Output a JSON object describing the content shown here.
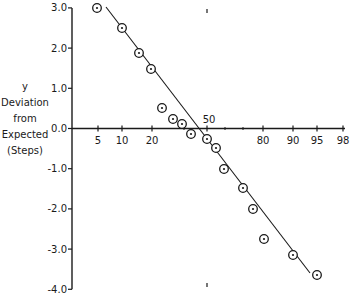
{
  "chart_data": {
    "type": "scatter",
    "title": "",
    "xlabel": "",
    "ylabel": [
      "y",
      "Deviation",
      "from",
      "Expected",
      "(Steps)"
    ],
    "x_scale": "normal-probability",
    "x_ticks": [
      5,
      10,
      20,
      50,
      80,
      90,
      95,
      98
    ],
    "x_minor_ticks": [
      30,
      60,
      70
    ],
    "y_ticks": [
      "3.0",
      "2.0",
      "1.0",
      "0.0",
      "-1.0",
      "-2.0",
      "-3.0",
      "-4.0"
    ],
    "ylim": [
      -4.0,
      3.0
    ],
    "grid": false,
    "legend": null,
    "marker": "circled-dot",
    "series": [
      {
        "name": "observed",
        "points": [
          {
            "x": 5,
            "y": 3.0
          },
          {
            "x": 10,
            "y": 2.5
          },
          {
            "x": 15,
            "y": 1.9
          },
          {
            "x": 20,
            "y": 1.5
          },
          {
            "x": 25,
            "y": 0.5
          },
          {
            "x": 30,
            "y": 0.25
          },
          {
            "x": 35,
            "y": 0.1
          },
          {
            "x": 40,
            "y": -0.15
          },
          {
            "x": 50,
            "y": -0.3
          },
          {
            "x": 55,
            "y": -0.5
          },
          {
            "x": 60,
            "y": -1.0
          },
          {
            "x": 70,
            "y": -1.5
          },
          {
            "x": 75,
            "y": -2.0
          },
          {
            "x": 80,
            "y": -2.75
          },
          {
            "x": 90,
            "y": -3.15
          },
          {
            "x": 95,
            "y": -3.65
          }
        ]
      }
    ],
    "fit_line": {
      "from": {
        "x": 5,
        "y": 3.0
      },
      "to": {
        "x": 94,
        "y": -3.6
      }
    },
    "annotations": [
      {
        "text": "50",
        "x": 50,
        "y": 0.0,
        "position": "above-axis"
      }
    ]
  },
  "px": {
    "axis_x": 72,
    "zero_y": 128.5,
    "px_per_unit": 40.2,
    "x_tick_px": {
      "5": 98,
      "10": 122,
      "20": 152,
      "30": 184,
      "50": 207,
      "60": 225,
      "70": 243,
      "80": 263,
      "90": 293,
      "95": 317,
      "98": 343
    },
    "point_px": [
      [
        97,
        8
      ],
      [
        122,
        28
      ],
      [
        139,
        53
      ],
      [
        151,
        69
      ],
      [
        162,
        108
      ],
      [
        173,
        119
      ],
      [
        182,
        124
      ],
      [
        191,
        134
      ],
      [
        207,
        139
      ],
      [
        216,
        148
      ],
      [
        224,
        169
      ],
      [
        243,
        188
      ],
      [
        253,
        209
      ],
      [
        264,
        239
      ],
      [
        293,
        255
      ],
      [
        317,
        275
      ]
    ],
    "line_px": [
      [
        106,
        7
      ],
      [
        310,
        273
      ]
    ]
  }
}
